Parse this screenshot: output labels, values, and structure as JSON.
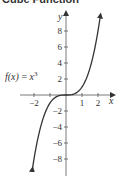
{
  "title": "Cube Function",
  "function_label": {
    "name": "f(x)",
    "equals": " = ",
    "base": "x",
    "exponent": "3"
  },
  "colors": {
    "axis": "#555555",
    "curve": "#333333",
    "text": "#333333"
  },
  "chart_data": {
    "type": "line",
    "title": "Cube Function",
    "xlabel": "x",
    "ylabel": "y",
    "x_ticks": [
      -2,
      -1,
      1,
      2
    ],
    "x_tick_labels": [
      "-2",
      "1",
      "2"
    ],
    "y_ticks": [
      8,
      6,
      4,
      2,
      -2,
      -4,
      -6,
      -8
    ],
    "y_tick_labels": [
      "8",
      "6",
      "4",
      "2",
      "-2",
      "-4",
      "-6",
      "-8"
    ],
    "xlim": [
      -2.1,
      2.9
    ],
    "ylim": [
      -10,
      10
    ],
    "grid": false,
    "series": [
      {
        "name": "f(x) = x^3",
        "x": [
          -2.1,
          -2,
          -1.5,
          -1,
          -0.5,
          0,
          0.5,
          1,
          1.5,
          2,
          2.15
        ],
        "y": [
          -9.26,
          -8,
          -3.375,
          -1,
          -0.125,
          0,
          0.125,
          1,
          3.375,
          8,
          9.94
        ]
      }
    ],
    "annotations": [
      "f(x) = x^3"
    ]
  }
}
